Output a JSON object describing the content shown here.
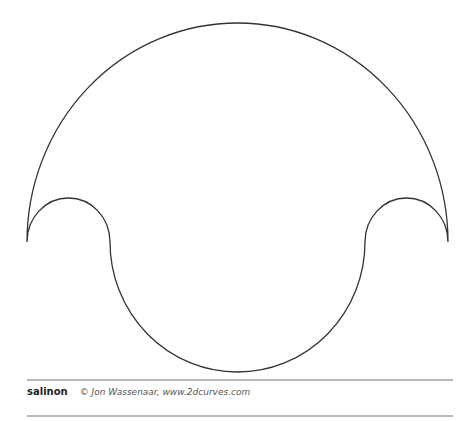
{
  "figure": {
    "name": "salinon",
    "credit": "© Jon Wassenaar, www.2dcurves.com",
    "stroke_color": "#333333",
    "rule_color": "#b9b9b9"
  }
}
